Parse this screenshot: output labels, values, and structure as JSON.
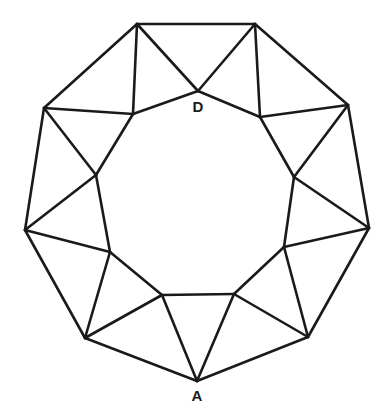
{
  "diagram": {
    "type": "star-polygon-ring",
    "stroke_color": "#1a1a1a",
    "outer_vertices": [
      [
        137,
        24
      ],
      [
        255,
        24
      ],
      [
        348,
        105
      ],
      [
        369,
        228
      ],
      [
        308,
        337
      ],
      [
        197,
        381
      ],
      [
        85,
        338
      ],
      [
        25,
        230
      ],
      [
        44,
        108
      ]
    ],
    "inner_vertices": [
      [
        198,
        91
      ],
      [
        260,
        117
      ],
      [
        294,
        177
      ],
      [
        284,
        247
      ],
      [
        234,
        294
      ],
      [
        162,
        295
      ],
      [
        110,
        252
      ],
      [
        96,
        175
      ],
      [
        133,
        114
      ]
    ],
    "labels": [
      {
        "text": "D",
        "x": 198,
        "y": 112
      },
      {
        "text": "A",
        "x": 197,
        "y": 401
      }
    ]
  }
}
